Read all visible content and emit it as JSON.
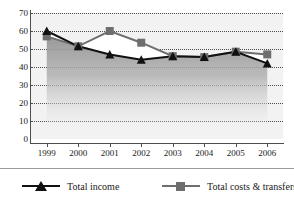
{
  "chart_data": {
    "type": "line",
    "title": "",
    "xlabel": "",
    "ylabel": "",
    "categories": [
      "1999",
      "2000",
      "2001",
      "2002",
      "2003",
      "2004",
      "2005",
      "2006"
    ],
    "yticks": [
      0,
      10,
      20,
      30,
      40,
      50,
      60,
      70
    ],
    "ylim": [
      0,
      70
    ],
    "grid": true,
    "legend_position": "bottom",
    "series": [
      {
        "name": "Total income",
        "marker": "triangle",
        "color": "#111111",
        "values": [
          60,
          51.5,
          47,
          44,
          46,
          45.5,
          48.5,
          42
        ]
      },
      {
        "name": "Total costs & transfers",
        "marker": "square",
        "color": "#6e6e6e",
        "values": [
          57,
          51.5,
          60,
          53.5,
          46,
          45.5,
          48.5,
          47
        ]
      }
    ]
  },
  "legend": {
    "items": [
      {
        "label": "Total income",
        "marker": "triangle-marker",
        "color": "#111111"
      },
      {
        "label": "Total costs & transfers",
        "marker": "square-marker",
        "color": "#6e6e6e"
      }
    ]
  },
  "colors": {
    "plot_background": "#f2f2f2",
    "area_fill": "#9a9a9a",
    "grid": "#4a4a4a",
    "axis": "#4d4d4d",
    "income_line": "#111111",
    "costs_line": "#6e6e6e"
  }
}
